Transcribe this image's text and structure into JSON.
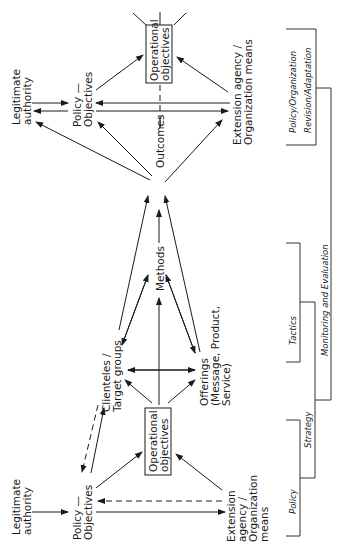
{
  "diagram": {
    "orientation": "rotated-90-ccw",
    "top_cluster": {
      "legitimate_authority": [
        "Legitimate",
        "authority"
      ],
      "policy_objectives": [
        "Policy —",
        "Objectives"
      ],
      "operational_objectives": [
        "Operational",
        "objectives"
      ],
      "extension_agency": [
        "Extension agency /",
        "Organization means"
      ]
    },
    "middle": {
      "outcomes": "Outcomes",
      "methods": "Methods",
      "clienteles": [
        "Clienteles /",
        "Target groups"
      ],
      "offerings": [
        "Offerings",
        "(Message, Product,",
        "Service)"
      ]
    },
    "bottom_cluster": {
      "legitimate_authority": [
        "Legitimate",
        "authority"
      ],
      "policy_objectives": [
        "Policy —",
        "Objectives"
      ],
      "operational_objectives": [
        "Operational",
        "objectives"
      ],
      "extension_agency": [
        "Extension",
        "agency /",
        "Organization",
        "means"
      ]
    },
    "phases": {
      "policy": "Policy",
      "strategy": "Strategy",
      "tactics": "Tactics",
      "monitoring": "Monitoring and Evaluation",
      "revision_1": "Policy/Organization",
      "revision_2": "Revision/Adaptation"
    },
    "colors": {
      "ink": "#1a1a1a",
      "background": "#ffffff"
    }
  }
}
